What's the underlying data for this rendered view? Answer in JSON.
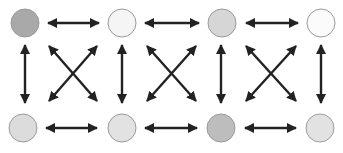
{
  "diagram": {
    "type": "graph",
    "layout": "4x2 grid",
    "arrow_color": "#222222",
    "node_stroke": "#9a9a9a",
    "nodes": [
      {
        "id": "t1",
        "row": 0,
        "col": 0,
        "cx": 25,
        "cy": 23,
        "r": 14,
        "fill": "#a9a9a9"
      },
      {
        "id": "t2",
        "row": 0,
        "col": 1,
        "cx": 122,
        "cy": 23,
        "r": 14,
        "fill": "#f5f5f5"
      },
      {
        "id": "t3",
        "row": 0,
        "col": 2,
        "cx": 222,
        "cy": 23,
        "r": 14,
        "fill": "#d6d6d6"
      },
      {
        "id": "t4",
        "row": 0,
        "col": 3,
        "cx": 321,
        "cy": 23,
        "r": 14,
        "fill": "#fbfbfb"
      },
      {
        "id": "b1",
        "row": 1,
        "col": 0,
        "cx": 23,
        "cy": 128,
        "r": 14,
        "fill": "#dcdcdc"
      },
      {
        "id": "b2",
        "row": 1,
        "col": 1,
        "cx": 122,
        "cy": 128,
        "r": 14,
        "fill": "#e2e2e2"
      },
      {
        "id": "b3",
        "row": 1,
        "col": 2,
        "cx": 221,
        "cy": 128,
        "r": 14,
        "fill": "#bdbdbd"
      },
      {
        "id": "b4",
        "row": 1,
        "col": 3,
        "cx": 320,
        "cy": 128,
        "r": 14,
        "fill": "#e2e2e2"
      }
    ],
    "edges": [
      {
        "from": "t1",
        "to": "t2",
        "x1": 48,
        "y1": 23,
        "x2": 99,
        "y2": 23
      },
      {
        "from": "t2",
        "to": "t3",
        "x1": 145,
        "y1": 23,
        "x2": 199,
        "y2": 23
      },
      {
        "from": "t3",
        "to": "t4",
        "x1": 246,
        "y1": 23,
        "x2": 298,
        "y2": 23
      },
      {
        "from": "b1",
        "to": "b2",
        "x1": 46,
        "y1": 128,
        "x2": 97,
        "y2": 128
      },
      {
        "from": "b2",
        "to": "b3",
        "x1": 145,
        "y1": 128,
        "x2": 197,
        "y2": 128
      },
      {
        "from": "b3",
        "to": "b4",
        "x1": 245,
        "y1": 128,
        "x2": 296,
        "y2": 128
      },
      {
        "from": "t1",
        "to": "b1",
        "x1": 25,
        "y1": 45,
        "x2": 25,
        "y2": 103
      },
      {
        "from": "t2",
        "to": "b2",
        "x1": 122,
        "y1": 45,
        "x2": 122,
        "y2": 103
      },
      {
        "from": "t3",
        "to": "b3",
        "x1": 221,
        "y1": 45,
        "x2": 221,
        "y2": 103
      },
      {
        "from": "t4",
        "to": "b4",
        "x1": 321,
        "y1": 45,
        "x2": 321,
        "y2": 103
      },
      {
        "from": "b1",
        "to": "t2",
        "x1": 49,
        "y1": 101,
        "x2": 97,
        "y2": 46
      },
      {
        "from": "t1",
        "to": "b2",
        "x1": 49,
        "y1": 46,
        "x2": 97,
        "y2": 101
      },
      {
        "from": "b2",
        "to": "t3",
        "x1": 147,
        "y1": 101,
        "x2": 196,
        "y2": 46
      },
      {
        "from": "t2",
        "to": "b3",
        "x1": 147,
        "y1": 46,
        "x2": 196,
        "y2": 101
      },
      {
        "from": "b3",
        "to": "t4",
        "x1": 246,
        "y1": 101,
        "x2": 296,
        "y2": 46
      },
      {
        "from": "t3",
        "to": "b4",
        "x1": 246,
        "y1": 46,
        "x2": 296,
        "y2": 101
      }
    ]
  }
}
